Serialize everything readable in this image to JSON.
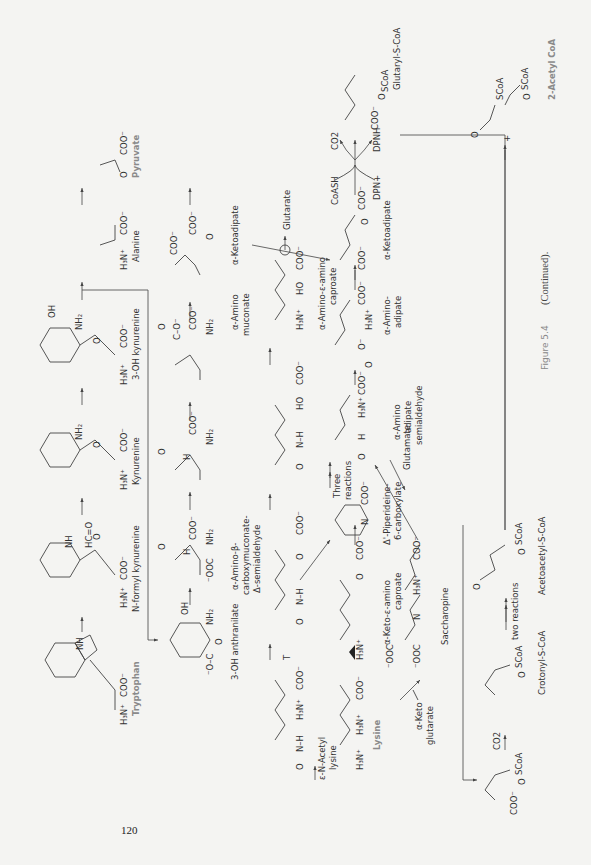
{
  "page": {
    "number": "120",
    "caption_label": "Figure 5.4",
    "caption_text": "(Continued)."
  },
  "tryptophan_branch": {
    "compounds": [
      {
        "name": "Tryptophan",
        "highlight": true,
        "groups": [
          "NH",
          "COO-",
          "H3N+"
        ]
      },
      {
        "name": "N-formyl kynurenine",
        "groups": [
          "NH",
          "HC=O",
          "O",
          "COO-",
          "H3N+"
        ]
      },
      {
        "name": "Kynurenine",
        "groups": [
          "NH2",
          "O",
          "COO-",
          "H3N+"
        ]
      },
      {
        "name": "3-OH kynurenine",
        "groups": [
          "OH",
          "NH2",
          "O",
          "COO-",
          "H3N+"
        ]
      },
      {
        "name": "Alanine",
        "groups": [
          "COO-",
          "H3N+"
        ]
      },
      {
        "name": "Pyruvate",
        "highlight": true,
        "groups": [
          "O",
          "COO-"
        ]
      },
      {
        "name": "3-OH anthranilate",
        "groups": [
          "OH",
          "NH2",
          "O",
          "-O-C"
        ]
      },
      {
        "name": "α-Amino-β-carboxymuconate-Δ-semialdehyde",
        "lines": [
          "α-Amino-β-",
          "carboxymuconate-",
          "Δ-semialdehyde"
        ],
        "groups": [
          "O",
          "H",
          "COO-",
          "NH2",
          "-OOC"
        ]
      },
      {
        "name": "aminomuconate semialdehyde",
        "groups": [
          "O",
          "H",
          "COO-",
          "NH2"
        ]
      },
      {
        "name": "α-Amino muconate",
        "lines": [
          "α-Amino",
          "muconate"
        ],
        "groups": [
          "O",
          "C-O-",
          "COO-",
          "NH2"
        ]
      },
      {
        "name": "α-Ketoadipate",
        "groups": [
          "COO-",
          "COO-",
          "O"
        ]
      }
    ]
  },
  "lysine_branch": {
    "compounds": [
      {
        "name": "Lysine",
        "highlight": true,
        "groups": [
          "H3N+",
          "H3N+",
          "COO-"
        ]
      },
      {
        "name": "ε-N-Acetyl lysine",
        "lines": [
          "ε-N-Acetyl",
          "lysine"
        ],
        "groups": [
          "O",
          "N-H",
          "H3N+",
          "COO-"
        ]
      },
      {
        "name": "α-Keto-ε-amino caproate",
        "lines": [
          "α-Keto-ε-amino",
          "caproate"
        ],
        "groups": [
          "H3N+",
          "O",
          "COO-"
        ]
      },
      {
        "name": "α-Keto glutarate",
        "lines": [
          "α-Keto",
          "glutarate"
        ]
      },
      {
        "name": "Saccharopine",
        "groups": [
          "-OOC",
          "-OOC",
          "N",
          "H3N+",
          "COO-"
        ]
      },
      {
        "name": "Δ1-Piperideine-6-carboxylate",
        "lines": [
          "Δ'-Piperideine-",
          "6-carboxylate"
        ],
        "groups": [
          "N",
          "COO-"
        ]
      },
      {
        "name": "α-Amino adipate semialdehyde",
        "lines": [
          "α-Amino",
          "adipate",
          "semialdehyde"
        ],
        "groups": [
          "O",
          "H",
          "H3N+",
          "COO-"
        ]
      },
      {
        "name": "α-Amino-adipate",
        "lines": [
          "α-Amino-",
          "adipate"
        ],
        "groups": [
          "O",
          "O-",
          "H3N+",
          "COO-"
        ]
      },
      {
        "name": "α-Amino-ε-amino caproate",
        "lines": [
          "α-Amino-ε-amino",
          "caproate"
        ],
        "groups": [
          "H3N+",
          "HO",
          "COO-"
        ]
      },
      {
        "name": "α-Ketoadipate",
        "groups": [
          "COO-",
          "O",
          "COO-"
        ]
      },
      {
        "name": "Glutaryl-S-CoA",
        "groups": [
          "COO-",
          "O",
          "SCoA"
        ]
      },
      {
        "name": "glutaconyl-S-CoA",
        "groups": [
          "COO-",
          "O",
          "SCoA"
        ]
      },
      {
        "name": "Crotonyl-S-CoA",
        "groups": [
          "O",
          "SCoA"
        ]
      },
      {
        "name": "Acetoacetyl-S-CoA",
        "groups": [
          "O",
          "O",
          "SCoA"
        ]
      },
      {
        "name": "2-Acetyl CoA",
        "highlight": true,
        "groups": [
          "O",
          "SCoA",
          "O",
          "SCoA"
        ]
      }
    ]
  },
  "reaction_labels": {
    "glutarate": "Glutarate",
    "three_reactions": "Three reactions",
    "three_reactions_lines": [
      "Three",
      "reactions"
    ],
    "glutamate": "Glutamate",
    "two_reactions": "two reactions",
    "coash": "CoASH",
    "co2": "CO2",
    "dpn_plus": "DPN+",
    "dpnh": "DPNH",
    "co2_decarb": "CO2",
    "t_arrow": "T",
    "plus": "+"
  },
  "colors": {
    "background": "#f4f4f2",
    "ink": "#333333",
    "highlight_label": "#8a8a8a",
    "caption_label": "#888888"
  }
}
